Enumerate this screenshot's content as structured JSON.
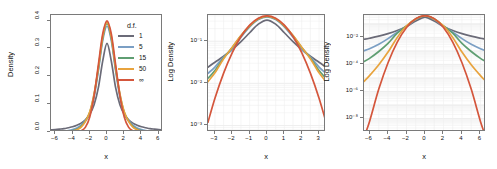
{
  "figure": {
    "title": "",
    "panel_count": 3
  },
  "legend": {
    "title": "d.f.",
    "entries": [
      {
        "label": "1",
        "color": "#6b6b78"
      },
      {
        "label": "5",
        "color": "#7b9fc4"
      },
      {
        "label": "15",
        "color": "#5f9e72"
      },
      {
        "label": "50",
        "color": "#e8a33d"
      },
      {
        "label": "∞",
        "color": "#d4563c"
      }
    ]
  },
  "chart_data": [
    {
      "type": "line",
      "panel": 1,
      "title": "",
      "xlabel": "x",
      "ylabel": "Density",
      "xlim": [
        -6.5,
        6.5
      ],
      "ylim": [
        0.0,
        0.42
      ],
      "xticks": [
        "-6",
        "-4",
        "-2",
        "0",
        "2",
        "4",
        "6"
      ],
      "xtick_values": [
        -6,
        -4,
        -2,
        0,
        2,
        4,
        6
      ],
      "yticks": [
        "0.0",
        "0.1",
        "0.2",
        "0.3",
        "0.4"
      ],
      "ytick_values": [
        0.0,
        0.1,
        0.2,
        0.3,
        0.4
      ],
      "grid": false,
      "yscale": "linear",
      "legend_position": "top-right-inside",
      "x": [
        -6.5,
        -6,
        -5.5,
        -5,
        -4.5,
        -4,
        -3.5,
        -3,
        -2.5,
        -2,
        -1.5,
        -1,
        -0.5,
        0,
        0.5,
        1,
        1.5,
        2,
        2.5,
        3,
        3.5,
        4,
        4.5,
        5,
        5.5,
        6,
        6.5
      ],
      "series": [
        {
          "name": "1",
          "color": "#6b6b78",
          "values": [
            0.0074,
            0.0086,
            0.0103,
            0.0122,
            0.0153,
            0.0187,
            0.0243,
            0.0318,
            0.0439,
            0.0637,
            0.0979,
            0.1592,
            0.2546,
            0.3183,
            0.2546,
            0.1592,
            0.0979,
            0.0637,
            0.0439,
            0.0318,
            0.0243,
            0.0187,
            0.0153,
            0.0122,
            0.0103,
            0.0086,
            0.0074
          ]
        },
        {
          "name": "5",
          "color": "#7b9fc4",
          "values": [
            0.0011,
            0.0016,
            0.0023,
            0.0035,
            0.0054,
            0.0086,
            0.0143,
            0.0244,
            0.0422,
            0.0651,
            0.1245,
            0.2197,
            0.3279,
            0.3796,
            0.3279,
            0.2197,
            0.1245,
            0.0651,
            0.0422,
            0.0244,
            0.0143,
            0.0086,
            0.0054,
            0.0035,
            0.0023,
            0.0016,
            0.0011
          ]
        },
        {
          "name": "15",
          "color": "#5f9e72",
          "values": [
            0.0002,
            0.0004,
            0.0007,
            0.0012,
            0.0024,
            0.0048,
            0.0098,
            0.0202,
            0.0401,
            0.0708,
            0.1339,
            0.2274,
            0.3368,
            0.3891,
            0.3368,
            0.2274,
            0.1339,
            0.0708,
            0.0401,
            0.0202,
            0.0098,
            0.0048,
            0.0024,
            0.0012,
            0.0007,
            0.0004,
            0.0002
          ]
        },
        {
          "name": "50",
          "color": "#e8a33d",
          "values": [
            4e-05,
            0.0001,
            0.0003,
            0.0006,
            0.0014,
            0.0033,
            0.0077,
            0.0178,
            0.0383,
            0.0724,
            0.1367,
            0.2317,
            0.3419,
            0.3947,
            0.3419,
            0.2317,
            0.1367,
            0.0724,
            0.0383,
            0.0178,
            0.0077,
            0.0033,
            0.0014,
            0.0006,
            0.0003,
            0.0001,
            4e-05
          ]
        },
        {
          "name": "∞",
          "color": "#d4563c",
          "values": [
            2e-08,
            0.0,
            1e-07,
            1.5e-06,
            1.6e-05,
            0.0001338,
            0.0008727,
            0.0044318,
            0.0175283,
            0.053991,
            0.1295176,
            0.2419707,
            0.3520653,
            0.3989423,
            0.3520653,
            0.2419707,
            0.1295176,
            0.053991,
            0.0175283,
            0.0044318,
            0.0008727,
            0.0001338,
            1.6e-05,
            1.5e-06,
            1e-07,
            0.0,
            2e-08
          ]
        }
      ]
    },
    {
      "type": "line",
      "panel": 2,
      "title": "",
      "xlabel": "x",
      "ylabel": "Log Density",
      "xlim": [
        -3.4,
        3.4
      ],
      "ylim": [
        0.0007,
        0.42
      ],
      "xticks": [
        "-3",
        "-2",
        "-1",
        "0",
        "1",
        "2",
        "3"
      ],
      "xtick_values": [
        -3,
        -2,
        -1,
        0,
        1,
        2,
        3
      ],
      "yticks": [
        "10-1",
        "10-2",
        "10-3"
      ],
      "ytick_exponents": [
        -1,
        -2,
        -3
      ],
      "grid": true,
      "yscale": "log",
      "legend_position": "none",
      "x": [
        -3.4,
        -3,
        -2.5,
        -2,
        -1.5,
        -1,
        -0.5,
        0,
        0.5,
        1,
        1.5,
        2,
        2.5,
        3,
        3.4
      ],
      "series": [
        {
          "name": "1",
          "color": "#6b6b78",
          "values": [
            0.0242,
            0.0318,
            0.0439,
            0.0637,
            0.0979,
            0.1592,
            0.2546,
            0.3183,
            0.2546,
            0.1592,
            0.0979,
            0.0637,
            0.0439,
            0.0318,
            0.0242
          ]
        },
        {
          "name": "5",
          "color": "#7b9fc4",
          "values": [
            0.0173,
            0.0244,
            0.0422,
            0.0651,
            0.1245,
            0.2197,
            0.3279,
            0.3796,
            0.3279,
            0.2197,
            0.1245,
            0.0651,
            0.0422,
            0.0244,
            0.0173
          ]
        },
        {
          "name": "15",
          "color": "#5f9e72",
          "values": [
            0.0132,
            0.0202,
            0.0401,
            0.0708,
            0.1339,
            0.2274,
            0.3368,
            0.3891,
            0.3368,
            0.2274,
            0.1339,
            0.0708,
            0.0401,
            0.0202,
            0.0132
          ]
        },
        {
          "name": "50",
          "color": "#e8a33d",
          "values": [
            0.011,
            0.0178,
            0.0383,
            0.0724,
            0.1367,
            0.2317,
            0.3419,
            0.3947,
            0.3419,
            0.2317,
            0.1367,
            0.0724,
            0.0383,
            0.0178,
            0.011
          ]
        },
        {
          "name": "∞",
          "color": "#d4563c",
          "values": [
            0.0012,
            0.0044318,
            0.0175283,
            0.053991,
            0.1295176,
            0.2419707,
            0.3520653,
            0.3989423,
            0.3520653,
            0.2419707,
            0.1295176,
            0.053991,
            0.0175283,
            0.0044318,
            0.0012
          ]
        }
      ]
    },
    {
      "type": "line",
      "panel": 3,
      "title": "",
      "xlabel": "x",
      "ylabel": "Log Density",
      "xlim": [
        -6.6,
        6.6
      ],
      "ylim": [
        1e-09,
        0.45
      ],
      "xticks": [
        "-6",
        "-4",
        "-2",
        "0",
        "2",
        "4",
        "6"
      ],
      "xtick_values": [
        -6,
        -4,
        -2,
        0,
        2,
        4,
        6
      ],
      "yticks": [
        "10-2",
        "10-4",
        "10-6",
        "10-8"
      ],
      "ytick_exponents": [
        -2,
        -4,
        -6,
        -8
      ],
      "grid": true,
      "yscale": "log",
      "legend_position": "none",
      "x": [
        -6.6,
        -6,
        -5,
        -4,
        -3,
        -2,
        -1,
        0,
        1,
        2,
        3,
        4,
        5,
        6,
        6.6
      ],
      "series": [
        {
          "name": "1",
          "color": "#6b6b78",
          "values": [
            0.0072,
            0.0086,
            0.0122,
            0.0187,
            0.0318,
            0.0637,
            0.1592,
            0.3183,
            0.1592,
            0.0637,
            0.0318,
            0.0187,
            0.0122,
            0.0086,
            0.0072
          ]
        },
        {
          "name": "5",
          "color": "#7b9fc4",
          "values": [
            0.00102,
            0.00145,
            0.00308,
            0.00807,
            0.02441,
            0.06509,
            0.21974,
            0.37961,
            0.21974,
            0.06509,
            0.02441,
            0.00807,
            0.00308,
            0.00145,
            0.00102
          ]
        },
        {
          "name": "15",
          "color": "#5f9e72",
          "values": [
            0.00016,
            0.00028,
            0.0009,
            0.00357,
            0.02019,
            0.07083,
            0.22741,
            0.3891,
            0.22741,
            0.07083,
            0.02019,
            0.00357,
            0.0009,
            0.00028,
            0.00016
          ]
        },
        {
          "name": "50",
          "color": "#e8a33d",
          "values": [
            5.5e-06,
            1.48e-05,
            9.43e-05,
            0.0008112,
            0.009945,
            0.0723851,
            0.231708,
            0.3947082,
            0.231708,
            0.0723851,
            0.009945,
            0.0008112,
            9.43e-05,
            1.48e-05,
            5.5e-06
          ]
        },
        {
          "name": "∞",
          "color": "#d4563c",
          "values": [
            4e-10,
            6.1e-09,
            1.49e-06,
            0.0001338,
            0.0044318,
            0.053991,
            0.2419707,
            0.3989423,
            0.2419707,
            0.053991,
            0.0044318,
            0.0001338,
            1.49e-06,
            6.1e-09,
            4e-10
          ]
        }
      ]
    }
  ]
}
